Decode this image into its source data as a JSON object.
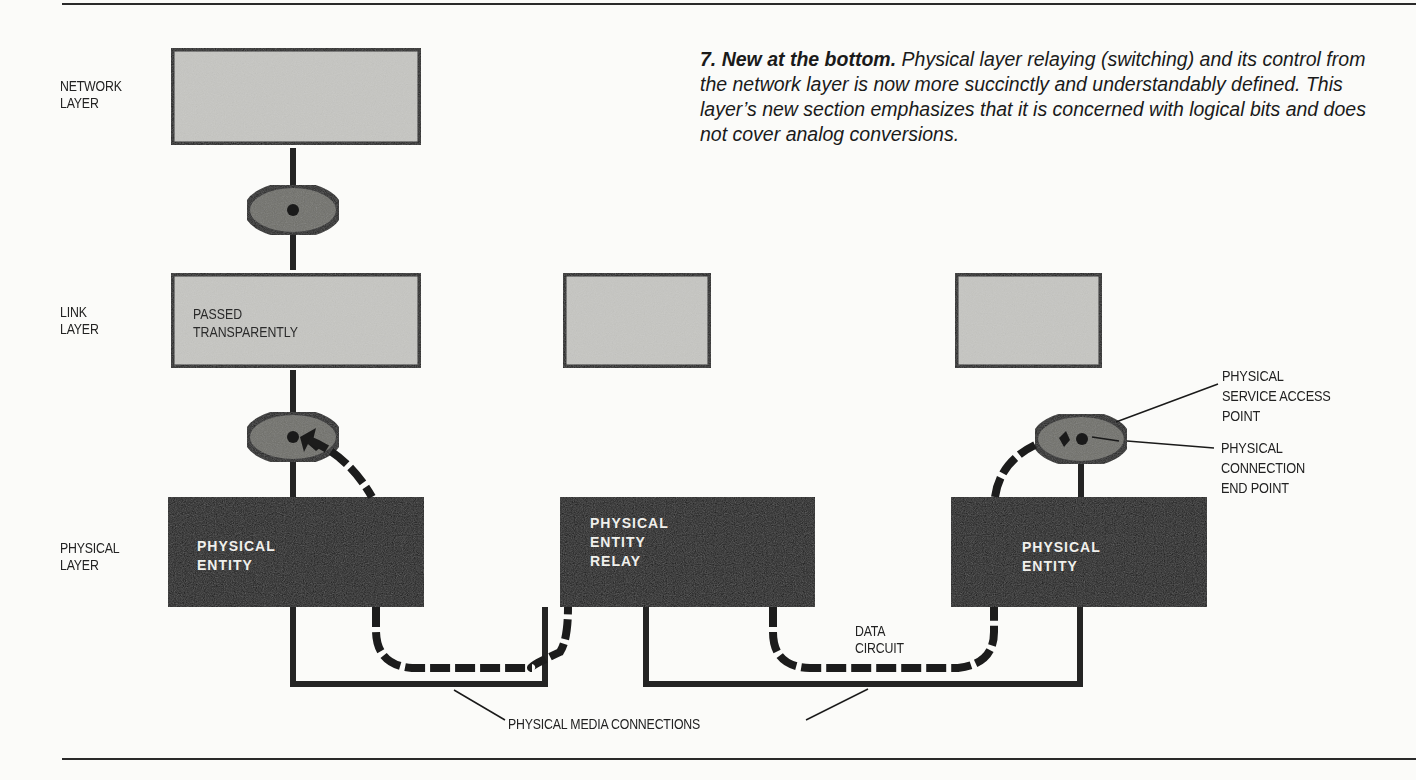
{
  "caption": {
    "heading": "7. New at the bottom.",
    "body": "Physical layer relaying (switching) and its control from the network layer is now more succinctly and understandably defined. This layer’s new section emphasizes that it is concerned with logical bits and does not cover analog conversions."
  },
  "layers": {
    "network": {
      "line1": "NETWORK",
      "line2": "LAYER"
    },
    "link": {
      "line1": "LINK",
      "line2": "LAYER"
    },
    "physical": {
      "line1": "PHYSICAL",
      "line2": "LAYER"
    }
  },
  "boxes": {
    "link_left": {
      "line1": "PASSED",
      "line2": "TRANSPARENTLY"
    },
    "entity_left": {
      "line1": "PHYSICAL",
      "line2": "ENTITY"
    },
    "entity_relay": {
      "line1": "PHYSICAL",
      "line2": "ENTITY",
      "line3": "RELAY"
    },
    "entity_right": {
      "line1": "PHYSICAL",
      "line2": "ENTITY"
    }
  },
  "annotations": {
    "sap": {
      "line1": "PHYSICAL",
      "line2": "SERVICE ACCESS",
      "line3": "POINT"
    },
    "cep": {
      "line1": "PHYSICAL",
      "line2": "CONNECTION",
      "line3": "END POINT"
    },
    "data_circuit": {
      "line1": "DATA",
      "line2": "CIRCUIT"
    },
    "media": "PHYSICAL MEDIA CONNECTIONS"
  },
  "colors": {
    "upper_box_fill": "#c4c4c0",
    "entity_fill": "#1c1c1c",
    "sap_fill": "#6e6e6a",
    "ink": "#222222"
  }
}
